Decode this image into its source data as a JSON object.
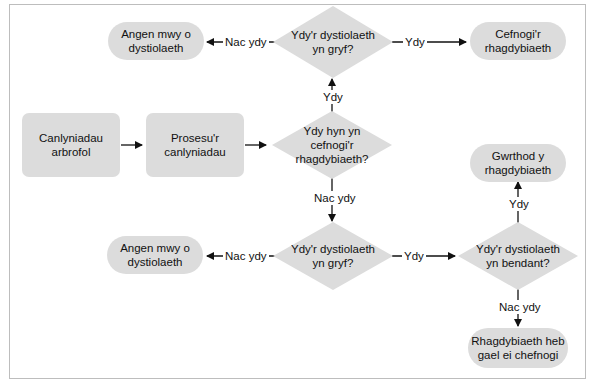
{
  "diagram": {
    "type": "flowchart",
    "colors": {
      "node_fill": "#dcdcdc",
      "frame_border": "#bdbdbd",
      "line": "#111111"
    },
    "nodes": {
      "results": "Canlyniadau\narbrofol",
      "process": "Prosesu'r\ncanlyniadau",
      "q_support": "Ydy hyn yn\ncefnogi'r\nrhagdybiaeth?",
      "q_strong_top": "Ydy'r dystiolaeth\nyn gryf?",
      "more_evidence_top": "Angen mwy o\ndystiolaeth",
      "support_hypothesis": "Cefnogi'r\nrhagdybiaeth",
      "q_strong_bottom": "Ydy'r dystiolaeth\nyn gryf?",
      "more_evidence_bottom": "Angen mwy o\ndystiolaeth",
      "q_definite": "Ydy'r dystiolaeth\nyn bendant?",
      "reject_hypothesis": "Gwrthod y\nrhagdybiaeth",
      "unsupported_hypothesis": "Rhagdybiaeth heb\ngael ei chefnogi"
    },
    "edge_labels": {
      "support_yes": "Ydy",
      "support_no": "Nac ydy",
      "strong_top_no": "Nac ydy",
      "strong_top_yes": "Ydy",
      "strong_bottom_no": "Nac ydy",
      "strong_bottom_yes": "Ydy",
      "definite_yes": "Ydy",
      "definite_no": "Nac ydy"
    }
  }
}
